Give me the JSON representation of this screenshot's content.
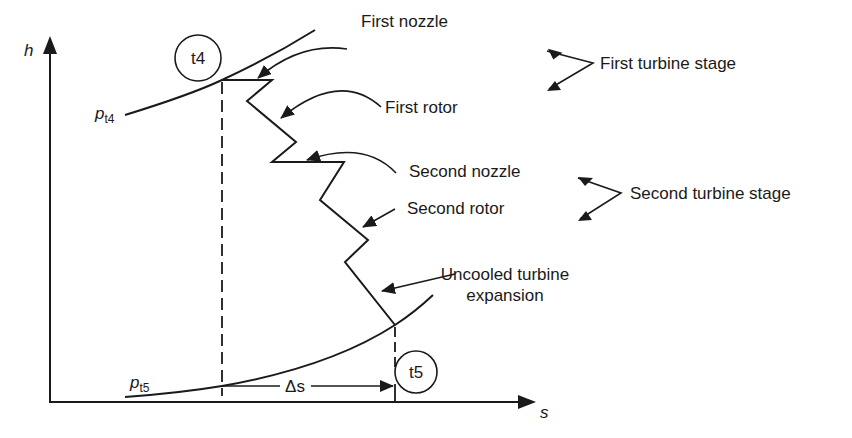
{
  "diagram": {
    "type": "h-s diagram",
    "axes": {
      "y_label": "h",
      "x_label": "s"
    },
    "isobars": [
      {
        "symbol": "p",
        "subscript": "t4"
      },
      {
        "symbol": "p",
        "subscript": "t5"
      }
    ],
    "states": [
      {
        "label": "t4"
      },
      {
        "label": "t5"
      }
    ],
    "delta_label": "Δs",
    "callouts": [
      {
        "label": "First nozzle"
      },
      {
        "label": "First rotor"
      },
      {
        "label": "Second nozzle"
      },
      {
        "label": "Second rotor"
      },
      {
        "label_line1": "Uncooled turbine",
        "label_line2": "expansion"
      }
    ],
    "stage_labels": [
      {
        "label": "First turbine stage"
      },
      {
        "label": "Second turbine stage"
      }
    ]
  },
  "colors": {
    "ink": "#1a1a1a",
    "background": "#ffffff"
  }
}
